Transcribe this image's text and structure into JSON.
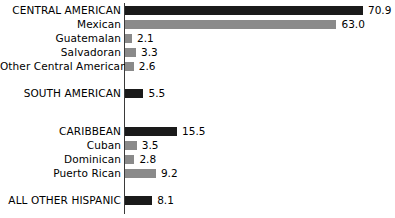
{
  "chart_data": {
    "type": "bar",
    "orientation": "horizontal",
    "title": "",
    "subtitle": "",
    "xlabel": "",
    "ylabel": "",
    "grid": false,
    "legend": null,
    "axis_line": "vertical baseline at left of bars",
    "xlim": [
      0,
      70.9
    ],
    "value_label_format": "one decimal",
    "colors": {
      "major_group_bar": "#1a1a1a",
      "subgroup_bar": "#8a8a8a",
      "axis": "#3a3a3a",
      "text": "#000000",
      "background": "#ffffff"
    },
    "categories": [
      "CENTRAL AMERICAN",
      "Mexican",
      "Guatemalan",
      "Salvadoran",
      "Other Central American",
      "SOUTH AMERICAN",
      "CARIBBEAN",
      "Cuban",
      "Dominican",
      "Puerto Rican",
      "ALL OTHER HISPANIC"
    ],
    "values": [
      70.9,
      63.0,
      2.1,
      3.3,
      2.6,
      5.5,
      15.5,
      3.5,
      2.8,
      9.2,
      8.1
    ],
    "rows": [
      {
        "label": "CENTRAL AMERICAN",
        "value": 70.9,
        "value_text": "70.9",
        "style": "dark",
        "group": "major",
        "top": 3
      },
      {
        "label": "Mexican",
        "value": 63.0,
        "value_text": "63.0",
        "style": "gray",
        "group": "sub",
        "top": 17
      },
      {
        "label": "Guatemalan",
        "value": 2.1,
        "value_text": "2.1",
        "style": "gray",
        "group": "sub",
        "top": 31
      },
      {
        "label": "Salvadoran",
        "value": 3.3,
        "value_text": "3.3",
        "style": "gray",
        "group": "sub",
        "top": 45
      },
      {
        "label": "Other Central American",
        "value": 2.6,
        "value_text": "2.6",
        "style": "gray",
        "group": "sub",
        "top": 59
      },
      {
        "label": "SOUTH AMERICAN",
        "value": 5.5,
        "value_text": "5.5",
        "style": "dark",
        "group": "major",
        "top": 86
      },
      {
        "label": "CARIBBEAN",
        "value": 15.5,
        "value_text": "15.5",
        "style": "dark",
        "group": "major",
        "top": 124
      },
      {
        "label": "Cuban",
        "value": 3.5,
        "value_text": "3.5",
        "style": "gray",
        "group": "sub",
        "top": 138
      },
      {
        "label": "Dominican",
        "value": 2.8,
        "value_text": "2.8",
        "style": "gray",
        "group": "sub",
        "top": 152
      },
      {
        "label": "Puerto Rican",
        "value": 9.2,
        "value_text": "9.2",
        "style": "gray",
        "group": "sub",
        "top": 166
      },
      {
        "label": "ALL OTHER HISPANIC",
        "value": 8.1,
        "value_text": "8.1",
        "style": "dark",
        "group": "major",
        "top": 193
      }
    ]
  }
}
